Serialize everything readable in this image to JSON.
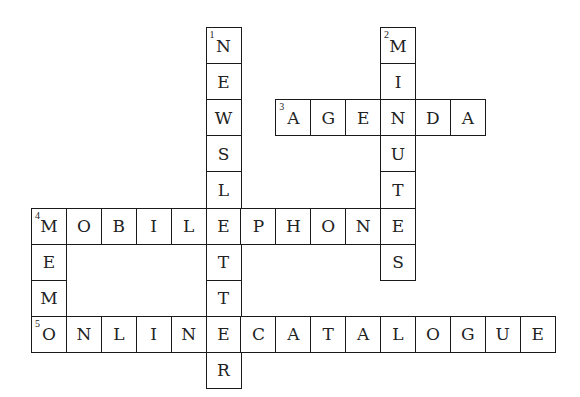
{
  "puzzle": {
    "grid": {
      "origin_x": 31,
      "origin_y": 27,
      "cell_w": 34.9,
      "cell_h": 36.1,
      "cols": 15,
      "rows": 10
    },
    "entries": [
      {
        "number": "1",
        "direction": "down",
        "answer": "NEWSLETTER",
        "row": 0,
        "col": 5
      },
      {
        "number": "2",
        "direction": "down",
        "answer": "MINUTES",
        "row": 0,
        "col": 10
      },
      {
        "number": "3",
        "direction": "across",
        "answer": "AGENDA",
        "row": 2,
        "col": 7
      },
      {
        "number": "4",
        "direction": "across",
        "answer": "MOBILEPHONE",
        "row": 5,
        "col": 0
      },
      {
        "number": "4",
        "direction": "down",
        "answer": "MEMO",
        "row": 5,
        "col": 0
      },
      {
        "number": "5",
        "direction": "across",
        "answer": "ONLINECATALOGUE",
        "row": 8,
        "col": 0
      }
    ]
  },
  "colors": {
    "border": "#1a1a1a",
    "text": "#222222",
    "background": "#ffffff"
  }
}
